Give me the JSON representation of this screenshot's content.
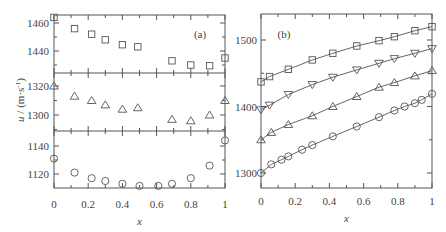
{
  "chart_data": [
    {
      "type": "scatter",
      "panel_label": "(a)",
      "xlabel": "x",
      "ylabel": "u / (m·s⁻¹)",
      "x_ticks": [
        "0",
        "0.2",
        "0.4",
        "0.6",
        "0.8",
        "1"
      ],
      "xlim": [
        0,
        1
      ],
      "subplots": [
        {
          "marker": "square",
          "y_ticks": [
            "1440",
            "1460"
          ],
          "ylim": [
            1422,
            1464
          ],
          "x": [
            0,
            0.12,
            0.22,
            0.3,
            0.4,
            0.49,
            0.69,
            0.8,
            0.91,
            1.0
          ],
          "values": [
            1464,
            1456,
            1452,
            1448,
            1444.5,
            1443,
            1433,
            1430,
            1429.5,
            1435
          ]
        },
        {
          "marker": "triangle-up",
          "y_ticks": [
            "1300",
            "1320"
          ],
          "ylim": [
            1290,
            1330
          ],
          "x": [
            0,
            0.12,
            0.22,
            0.3,
            0.4,
            0.49,
            0.69,
            0.8,
            0.91,
            1.0
          ],
          "values": [
            1320,
            1313,
            1310,
            1307,
            1304,
            1305,
            1297,
            1296,
            1300,
            1310
          ]
        },
        {
          "marker": "circle",
          "y_ticks": [
            "1120",
            "1140"
          ],
          "ylim": [
            1110,
            1150
          ],
          "x": [
            0,
            0.12,
            0.22,
            0.3,
            0.4,
            0.5,
            0.61,
            0.69,
            0.8,
            0.91,
            1.0
          ],
          "values": [
            1131,
            1121,
            1117,
            1115,
            1113,
            1111.5,
            1111.5,
            1113,
            1117,
            1126,
            1144
          ]
        }
      ]
    },
    {
      "type": "line",
      "panel_label": "(b)",
      "xlabel": "x",
      "ylabel": "",
      "x_ticks": [
        "0",
        "0.2",
        "0.4",
        "0.6",
        "0.8",
        "1"
      ],
      "y_ticks": [
        "1300",
        "1400",
        "1500"
      ],
      "xlim": [
        0,
        1
      ],
      "ylim": [
        1278,
        1540
      ],
      "series": [
        {
          "name": "squares",
          "marker": "square",
          "x": [
            0,
            0.05,
            0.16,
            0.3,
            0.42,
            0.56,
            0.69,
            0.78,
            0.9,
            1.0
          ],
          "values": [
            1437,
            1445,
            1456,
            1470,
            1480,
            1491,
            1499,
            1505,
            1514,
            1520
          ]
        },
        {
          "name": "down-triangles",
          "marker": "triangle-down",
          "x": [
            0,
            0.05,
            0.16,
            0.3,
            0.42,
            0.56,
            0.69,
            0.78,
            0.9,
            1.0
          ],
          "values": [
            1395,
            1402,
            1418,
            1433,
            1444,
            1455,
            1465,
            1472,
            1480,
            1487
          ]
        },
        {
          "name": "up-triangles",
          "marker": "triangle-up",
          "x": [
            0,
            0.06,
            0.16,
            0.3,
            0.42,
            0.56,
            0.69,
            0.78,
            0.9,
            1.0
          ],
          "values": [
            1350,
            1361,
            1373,
            1386,
            1400,
            1415,
            1429,
            1436,
            1446,
            1454
          ]
        },
        {
          "name": "circles",
          "marker": "circle",
          "x": [
            0,
            0.06,
            0.12,
            0.16,
            0.24,
            0.3,
            0.42,
            0.56,
            0.69,
            0.78,
            0.84,
            0.9,
            0.94,
            1.0
          ],
          "values": [
            1300,
            1313,
            1320,
            1325,
            1335,
            1342,
            1355,
            1370,
            1384,
            1394,
            1400,
            1405,
            1410,
            1419
          ]
        }
      ]
    }
  ]
}
